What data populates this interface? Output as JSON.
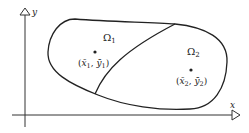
{
  "diagram": {
    "axes": {
      "x_label": "x",
      "y_label": "y"
    },
    "regions": [
      {
        "name": "Ω",
        "subscript": "1",
        "centroid_label": {
          "open": "(",
          "x": "x̄",
          "x_sub": "1",
          "sep": ", ",
          "y": "ȳ",
          "y_sub": "1",
          "close": ")"
        }
      },
      {
        "name": "Ω",
        "subscript": "2",
        "centroid_label": {
          "open": "(",
          "x": "x̄",
          "x_sub": "2",
          "sep": ", ",
          "y": "ȳ",
          "y_sub": "2",
          "close": ")"
        }
      }
    ],
    "colors": {
      "stroke": "#222222",
      "background": "#ffffff"
    }
  }
}
